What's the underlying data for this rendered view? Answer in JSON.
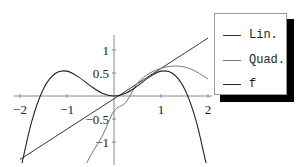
{
  "chart_data": {
    "type": "line",
    "title": "",
    "xlabel": "",
    "ylabel": "",
    "xlim": [
      -2,
      2
    ],
    "ylim": [
      -1.5,
      1.3
    ],
    "grid": false,
    "legend_position": "right-outside-top",
    "x_ticks": [
      -2,
      -1,
      1,
      2
    ],
    "x_tick_labels": [
      "−2",
      "−1",
      "1",
      "2"
    ],
    "y_ticks": [
      1,
      0.5,
      -0.5,
      -1
    ],
    "y_tick_labels": [
      "1",
      "0.5",
      "−0.5",
      "−1"
    ],
    "x": [
      -2,
      -1.75,
      -1.5,
      -1.25,
      -1,
      -0.75,
      -0.5,
      -0.25,
      0,
      0.25,
      0.5,
      0.75,
      1,
      1.25,
      1.5,
      1.75,
      2
    ],
    "series": [
      {
        "name": "Lin.",
        "color": "#333333",
        "values": [
          -1.38,
          -1.215,
          -1.05,
          -0.885,
          -0.72,
          -0.555,
          -0.39,
          -0.225,
          -0.06,
          0.105,
          0.27,
          0.435,
          0.6,
          0.765,
          0.93,
          1.095,
          1.26
        ]
      },
      {
        "name": "Quad.",
        "color": "#777777",
        "values": [
          -5.67,
          -4.74,
          -3.88,
          -3.1,
          -2.42,
          -1.82,
          -1.3,
          -0.87,
          -0.33,
          -0.14,
          0.28,
          0.49,
          0.6,
          0.65,
          0.63,
          0.53,
          0.37
        ]
      },
      {
        "name": "f",
        "color": "#222222",
        "values": [
          -1.66,
          -0.55,
          0.16,
          0.49,
          0.54,
          0.41,
          0.22,
          0.06,
          0,
          0.06,
          0.22,
          0.41,
          0.54,
          0.49,
          0.16,
          -0.55,
          -1.66
        ]
      }
    ]
  },
  "legend": {
    "items": [
      {
        "label": "Lin."
      },
      {
        "label": "Quad."
      },
      {
        "label": "f"
      }
    ]
  }
}
